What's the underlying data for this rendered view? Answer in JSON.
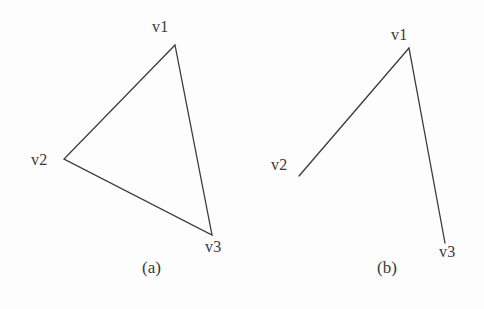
{
  "figure": {
    "background_color": "#fdfdfd",
    "stroke_color": "#3a3a3a",
    "text_color": "#3a3a3a",
    "stroke_width": 1.3,
    "width": 484,
    "height": 309
  },
  "panels": [
    {
      "id": "a",
      "caption": "(a)",
      "description": "closed triangle with vertices v1, v2, v3",
      "closed": true,
      "vertices": [
        {
          "name": "v1",
          "label": "v1",
          "x": 175,
          "y": 45
        },
        {
          "name": "v2",
          "label": "v2",
          "x": 64,
          "y": 159
        },
        {
          "name": "v3",
          "label": "v3",
          "x": 212,
          "y": 235
        }
      ],
      "edges": [
        {
          "from": "v1",
          "to": "v2"
        },
        {
          "from": "v2",
          "to": "v3"
        },
        {
          "from": "v3",
          "to": "v1"
        }
      ]
    },
    {
      "id": "b",
      "caption": "(b)",
      "description": "open polyline v2 to v1 to v3",
      "closed": false,
      "vertices": [
        {
          "name": "v1",
          "label": "v1",
          "x": 167,
          "y": 48
        },
        {
          "name": "v2",
          "label": "v2",
          "x": 57,
          "y": 176
        },
        {
          "name": "v3",
          "label": "v3",
          "x": 203,
          "y": 243
        }
      ],
      "edges": [
        {
          "from": "v2",
          "to": "v1"
        },
        {
          "from": "v1",
          "to": "v3"
        }
      ]
    }
  ]
}
